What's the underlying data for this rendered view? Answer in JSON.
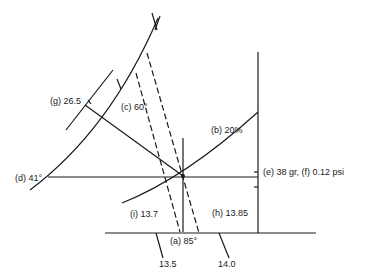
{
  "diagram": {
    "type": "nomogram",
    "labels": {
      "g": "(g) 26.5",
      "c": "(c) 60°",
      "b": "(b) 20%",
      "d": "(d) 41°",
      "e_f": "(e)   38 gr, (f)   0.12 psi",
      "i": "(i) 13.7",
      "h": "(h)   13.85",
      "a": "(a) 85°",
      "tick_13_5": "13.5",
      "tick_14_0": "14.0"
    },
    "colors": {
      "line": "#1a1a1a",
      "background": "#ffffff"
    }
  }
}
